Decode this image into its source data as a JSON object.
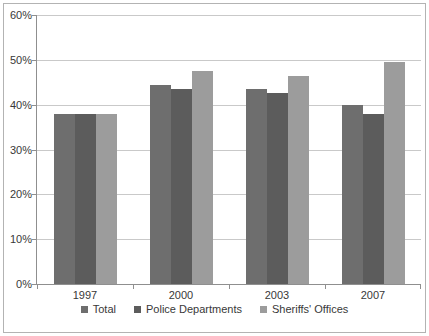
{
  "chart_data": {
    "type": "bar",
    "categories": [
      "1997",
      "2000",
      "2003",
      "2007"
    ],
    "series": [
      {
        "name": "Total",
        "color": "#6E6E6E",
        "values": [
          38,
          44.5,
          43.5,
          40
        ]
      },
      {
        "name": "Police Departments",
        "color": "#5C5C5C",
        "values": [
          38,
          43.5,
          42.5,
          38
        ]
      },
      {
        "name": "Sheriffs' Offices",
        "color": "#9C9C9C",
        "values": [
          38,
          47.5,
          46.5,
          49.5
        ]
      }
    ],
    "yticks": [
      {
        "value": 0,
        "label": "0%"
      },
      {
        "value": 10,
        "label": "10%"
      },
      {
        "value": 20,
        "label": "20%"
      },
      {
        "value": 30,
        "label": "30%"
      },
      {
        "value": 40,
        "label": "40%"
      },
      {
        "value": 50,
        "label": "50%"
      },
      {
        "value": 60,
        "label": "60%"
      }
    ],
    "ylim": [
      0,
      60
    ],
    "grid": true,
    "legend_position": "bottom"
  },
  "colors": {
    "background": "#FFFFFF",
    "frame_border": "#B3B3B3",
    "gridline": "#C9C9C9",
    "axis": "#8F8F8F",
    "text": "#383838"
  }
}
